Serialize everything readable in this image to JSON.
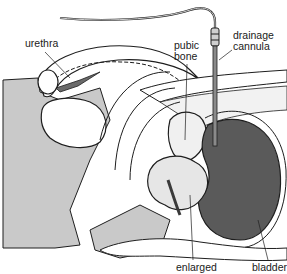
{
  "figure": {
    "colors": {
      "background": "#ffffff",
      "tissue_gray": "#c9c9c9",
      "bladder_dark": "#5a5a5a",
      "outline": "#1e1e1e",
      "prostate_stipple": "#e6e6e6"
    }
  },
  "labels": {
    "urethra": "urethra",
    "pubic_bone_line1": "pubic",
    "pubic_bone_line2": "bone",
    "cannula_line1": "drainage",
    "cannula_line2": "cannula",
    "enlarged": "enlarged",
    "bladder": "bladder"
  }
}
